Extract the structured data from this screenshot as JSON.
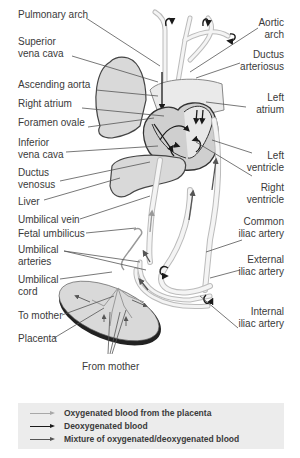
{
  "labels": {
    "pulmonary_arch": "Pulmonary arch",
    "superior_vena_cava_1": "Superior",
    "superior_vena_cava_2": "vena cava",
    "ascending_aorta": "Ascending aorta",
    "right_atrium": "Right atrium",
    "foramen_ovale": "Foramen ovale",
    "inferior_vena_cava_1": "Inferior",
    "inferior_vena_cava_2": "vena cava",
    "ductus_venosus_1": "Ductus",
    "ductus_venosus_2": "venosus",
    "liver": "Liver",
    "umbilical_vein": "Umbilical vein",
    "fetal_umbilicus": "Fetal umbilicus",
    "umbilical_arteries_1": "Umbilical",
    "umbilical_arteries_2": "arteries",
    "umbilical_cord_1": "Umbilical",
    "umbilical_cord_2": "cord",
    "to_mother": "To mother",
    "placenta": "Placenta",
    "from_mother": "From mother",
    "aortic_arch_1": "Aortic",
    "aortic_arch_2": "arch",
    "ductus_arteriosus_1": "Ductus",
    "ductus_arteriosus_2": "arteriosus",
    "left_atrium_1": "Left",
    "left_atrium_2": "atrium",
    "left_ventricle_1": "Left",
    "left_ventricle_2": "ventricle",
    "right_ventricle_1": "Right",
    "right_ventricle_2": "ventricle",
    "common_iliac_1": "Common",
    "common_iliac_2": "iliac artery",
    "external_iliac_1": "External",
    "external_iliac_2": "iliac artery",
    "internal_iliac_1": "Internal",
    "internal_iliac_2": "iliac artery"
  },
  "legend": {
    "items": [
      {
        "label": "Oxygenated blood from the placenta",
        "color": "#a8a8a8"
      },
      {
        "label": "Deoxygenated blood",
        "color": "#1a1a1a"
      },
      {
        "label": "Mixture of oxygenated/deoxygenated blood",
        "color": "#555555"
      }
    ],
    "background": "#ececec"
  },
  "colors": {
    "organ_fill": "#d9d9d9",
    "outline": "#444444",
    "vessel": "#f2f2f2",
    "leader_line": "#555555"
  }
}
